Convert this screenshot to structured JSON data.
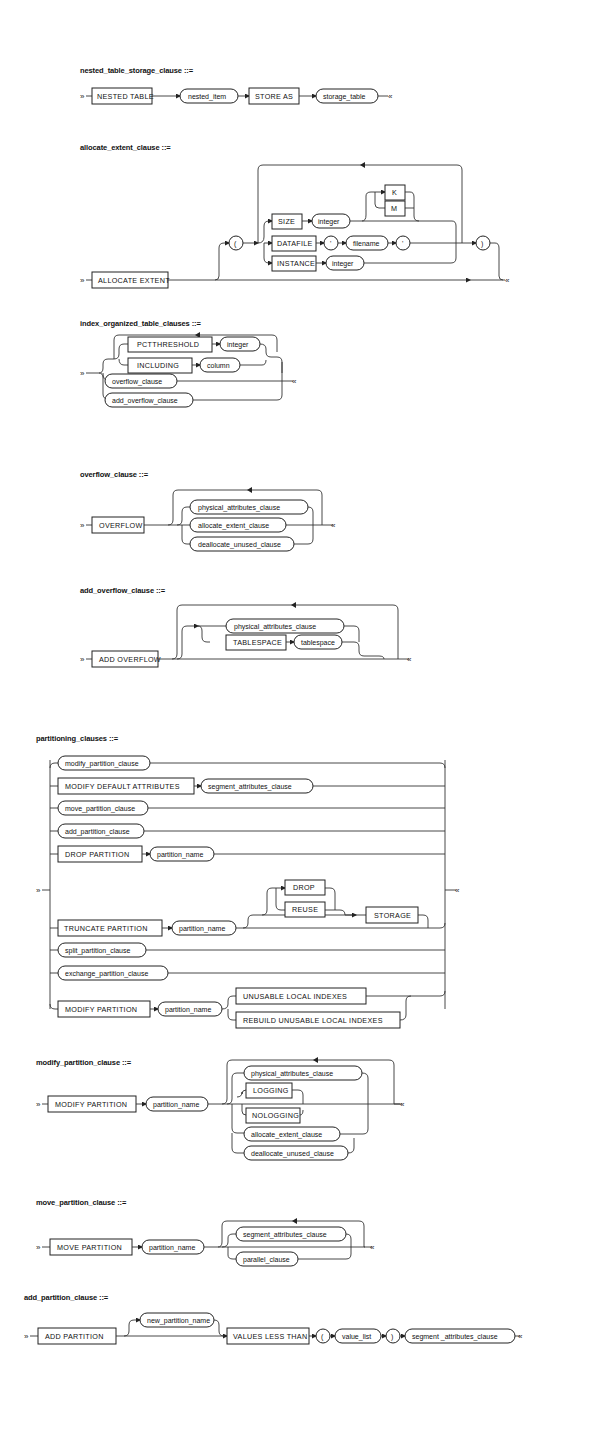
{
  "document": {
    "diagrams": [
      {
        "id": "nested_table_storage_clause",
        "title": "nested_table_storage_clause ::=",
        "items": [
          "NESTED TABLE",
          "nested_item",
          "STORE AS",
          "storage_table"
        ]
      },
      {
        "id": "allocate_extent_clause",
        "title": "allocate_extent_clause ::=",
        "items": [
          "ALLOCATE EXTENT",
          "(",
          "SIZE",
          "integer",
          "K",
          "M",
          "DATAFILE",
          "'",
          "filename",
          "'",
          "INSTANCE",
          "integer",
          ")"
        ]
      },
      {
        "id": "index_organized_table_clauses",
        "title": "index_organized_table_clauses ::=",
        "items": [
          "PCTTHRESHOLD",
          "integer",
          "INCLUDING",
          "column",
          "overflow_clause",
          "add_overflow_clause"
        ]
      },
      {
        "id": "overflow_clause",
        "title": "overflow_clause ::=",
        "items": [
          "OVERFLOW",
          "physical_attributes_clause",
          "allocate_extent_clause",
          "deallocate_unused_clause"
        ]
      },
      {
        "id": "add_overflow_clause",
        "title": "add_overflow_clause ::=",
        "items": [
          "ADD OVERFLOW",
          "physical_attributes_clause",
          "TABLESPACE",
          "tablespace"
        ]
      },
      {
        "id": "partitioning_clauses",
        "title": "partitioning_clauses ::=",
        "items": [
          "modify_partition_clause",
          "MODIFY DEFAULT ATTRIBUTES",
          "segment_attributes_clause",
          "move_partition_clause",
          "add_partition_clause",
          "DROP PARTITION",
          "partition_name",
          "DROP",
          "REUSE",
          "TRUNCATE PARTITION",
          "partition_name",
          "STORAGE",
          "split_partition_clause",
          "exchange_partition_clause",
          "MODIFY PARTITION",
          "partition_name",
          "UNUSABLE LOCAL INDEXES",
          "REBUILD UNUSABLE LOCAL INDEXES"
        ]
      },
      {
        "id": "modify_partition_clause",
        "title": "modify_partition_clause ::=",
        "items": [
          "MODIFY PARTITION",
          "partition_name",
          "physical_attributes_clause",
          "LOGGING",
          "NOLOGGING",
          "allocate_extent_clause",
          "deallocate_unused_clause"
        ]
      },
      {
        "id": "move_partition_clause",
        "title": "move_partition_clause ::=",
        "items": [
          "MOVE PARTITION",
          "partition_name",
          "segment_attributes_clause",
          "parallel_clause"
        ]
      },
      {
        "id": "add_partition_clause",
        "title": "add_partition_clause ::=",
        "items": [
          "ADD PARTITION",
          "new_partition_name",
          "VALUES LESS THAN",
          "(",
          "value_list",
          ")",
          "segment _attributes_clause"
        ]
      }
    ]
  }
}
